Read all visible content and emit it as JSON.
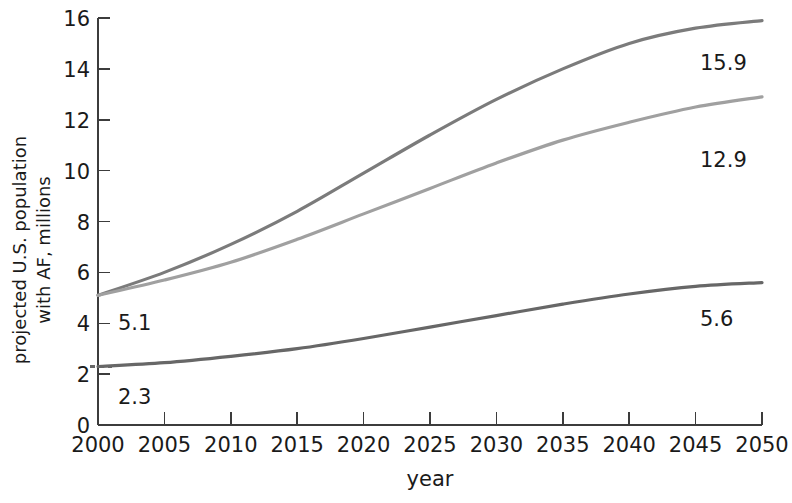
{
  "chart_data": {
    "type": "line",
    "title": "",
    "xlabel": "year",
    "ylabel": "projected U.S. population with AF, millions",
    "ylabel_line1": "projected U.S. population",
    "ylabel_line2": "with AF, millions",
    "xlim": [
      2000,
      2050
    ],
    "ylim": [
      0,
      16
    ],
    "xticks": [
      2000,
      2005,
      2010,
      2015,
      2020,
      2025,
      2030,
      2035,
      2040,
      2045,
      2050
    ],
    "yticks": [
      0,
      2,
      4,
      6,
      8,
      10,
      12,
      14,
      16
    ],
    "grid": false,
    "legend": "none",
    "x": [
      2000,
      2005,
      2010,
      2015,
      2020,
      2025,
      2030,
      2035,
      2040,
      2045,
      2050
    ],
    "series": [
      {
        "name": "upper projection",
        "color": "#7b7b7b",
        "values": [
          5.1,
          6.0,
          7.1,
          8.4,
          9.9,
          11.4,
          12.8,
          14.0,
          15.0,
          15.6,
          15.9
        ],
        "start_label": "5.1",
        "end_label": "15.9",
        "start_value": 5.1,
        "end_value": 15.9
      },
      {
        "name": "middle projection",
        "color": "#a0a0a0",
        "values": [
          5.1,
          5.7,
          6.4,
          7.3,
          8.3,
          9.3,
          10.3,
          11.2,
          11.9,
          12.5,
          12.9
        ],
        "start_label": "5.1",
        "end_label": "12.9",
        "start_value": 5.1,
        "end_value": 12.9
      },
      {
        "name": "lower projection",
        "color": "#676767",
        "values": [
          2.3,
          2.45,
          2.7,
          3.0,
          3.4,
          3.85,
          4.3,
          4.75,
          5.15,
          5.45,
          5.6
        ],
        "start_label": "2.3",
        "end_label": "5.6",
        "start_value": 2.3,
        "end_value": 5.6
      }
    ],
    "point_labels": [
      {
        "text": "5.1",
        "series": "upper projection",
        "position": "start"
      },
      {
        "text": "2.3",
        "series": "lower projection",
        "position": "start"
      },
      {
        "text": "15.9",
        "series": "upper projection",
        "position": "end"
      },
      {
        "text": "12.9",
        "series": "middle projection",
        "position": "end"
      },
      {
        "text": "5.6",
        "series": "lower projection",
        "position": "end"
      }
    ],
    "axis_color": "#3c3c3c",
    "text_color": "#1a1a1a",
    "background": "#ffffff"
  }
}
